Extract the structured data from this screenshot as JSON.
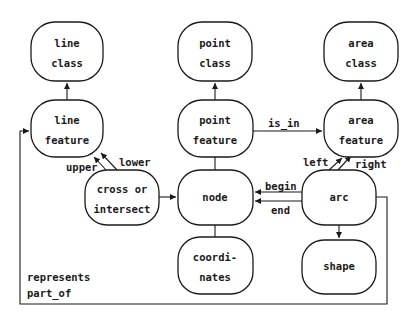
{
  "nodes": {
    "line_class": {
      "line1": "line",
      "line2": "class"
    },
    "point_class": {
      "line1": "point",
      "line2": "class"
    },
    "area_class": {
      "line1": "area",
      "line2": "class"
    },
    "line_feature": {
      "line1": "line",
      "line2": "feature"
    },
    "point_feature": {
      "line1": "point",
      "line2": "feature"
    },
    "area_feature": {
      "line1": "area",
      "line2": "feature"
    },
    "cross_or_intersect": {
      "line1": "cross or",
      "line2": "intersect"
    },
    "node": {
      "line1": "node"
    },
    "arc": {
      "line1": "arc"
    },
    "coordinates": {
      "line1": "coordi-",
      "line2": "nates"
    },
    "shape": {
      "line1": "shape"
    }
  },
  "edges": {
    "is_in": "is_in",
    "upper": "upper",
    "lower": "lower",
    "left": "left",
    "right": "right",
    "begin": "begin",
    "end": "end",
    "represents": "represents",
    "part_of": "part_of"
  }
}
